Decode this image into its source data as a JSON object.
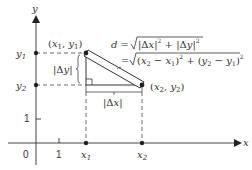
{
  "diagram": {
    "axes": {
      "x_label": "x",
      "y_label": "y",
      "origin_label": "0",
      "x_tick_one": "1",
      "y_tick_one": "1",
      "x_ticks": [
        "x1",
        "x2"
      ],
      "y_ticks": [
        "y1",
        "y2"
      ]
    },
    "points": {
      "p1_label": "(x1, y1)",
      "p2_label": "(x2, y2)"
    },
    "legs": {
      "dy_label": "|Δy|",
      "dx_label": "|Δx|"
    },
    "formula": {
      "line1": "d = √(|Δx|² + |Δy|²)",
      "line2": "= √((x2 − x1)² + (y2 − y1)²)"
    },
    "colors": {
      "ink": "#333333",
      "hypotenuse_fill": "#ffffff"
    }
  }
}
